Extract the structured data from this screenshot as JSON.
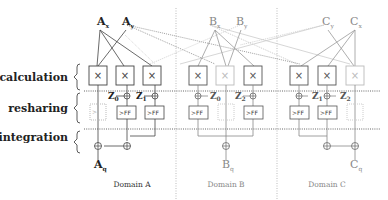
{
  "stages": {
    "calculation": "calculation",
    "resharing": "resharing",
    "integration": "integration"
  },
  "domains": [
    {
      "name": "Domain A",
      "inputs": [
        "A",
        "A"
      ],
      "input_subs": [
        "x",
        "y"
      ],
      "output": "A",
      "output_sub": "q",
      "z_labels": [
        "Z",
        "Z"
      ],
      "z_subs": [
        "0",
        "1"
      ]
    },
    {
      "name": "Domain B",
      "inputs": [
        "B",
        "B"
      ],
      "input_subs": [
        "x",
        "y"
      ],
      "output": "B",
      "output_sub": "q",
      "z_labels": [
        "Z",
        "Z"
      ],
      "z_subs": [
        "0",
        "2"
      ]
    },
    {
      "name": "Domain C",
      "inputs": [
        "C",
        "C"
      ],
      "input_subs": [
        "y",
        "x"
      ],
      "output": "C",
      "output_sub": "q",
      "z_labels": [
        "Z",
        "Z"
      ],
      "z_subs": [
        "1",
        "2"
      ]
    }
  ],
  "ff_label": "FF",
  "multiplier_symbol": "×",
  "colors": {
    "strong": "#444444",
    "faint": "#aaaaaa",
    "divider": "#bbbbbb"
  }
}
